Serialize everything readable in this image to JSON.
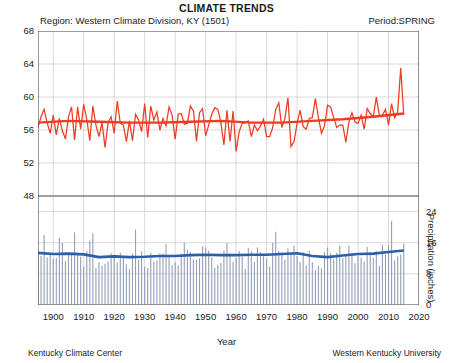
{
  "header": {
    "title": "CLIMATE TRENDS",
    "region": "Region: Western Climate Division, KY   (1501)",
    "period": "Period:SPRING"
  },
  "footer": {
    "left": "Kentucky Climate Center",
    "right": "Western Kentucky University"
  },
  "axes": {
    "xlabel": "Year",
    "ylabel_left": "Air Temperature (deg F)",
    "ylabel_right": "Precipitation (inches)",
    "temp_ticks": [
      "68",
      "64",
      "60",
      "56",
      "52",
      "48"
    ],
    "precip_ticks": [
      "24",
      "16",
      "8",
      "0"
    ],
    "year_ticks": [
      "1900",
      "1910",
      "1920",
      "1930",
      "1940",
      "1950",
      "1960",
      "1970",
      "1980",
      "1990",
      "2000",
      "2010",
      "2020"
    ]
  },
  "colors": {
    "temperature": "#ee3b22",
    "precipitation_bars": "#8d9bb5",
    "precipitation_trend": "#2b5fad",
    "grid": "#c9c9c9",
    "axis": "#555555"
  },
  "chart_data": {
    "type": "line",
    "title": "CLIMATE TRENDS",
    "subtitle": "Region: Western Climate Division, KY   (1501) — Period:SPRING",
    "xlabel": "Year",
    "xlim": [
      1895,
      2020
    ],
    "grid": true,
    "legend": "none",
    "panels": [
      {
        "name": "air-temperature",
        "ylabel": "Air Temperature (deg F)",
        "ylim": [
          48,
          68
        ],
        "yticks": [
          48,
          52,
          56,
          60,
          64,
          68
        ],
        "series": [
          {
            "name": "Spring mean air temperature",
            "type": "line",
            "color": "#ee3b22",
            "x": [
              1895,
              1896,
              1897,
              1898,
              1899,
              1900,
              1901,
              1902,
              1903,
              1904,
              1905,
              1906,
              1907,
              1908,
              1909,
              1910,
              1911,
              1912,
              1913,
              1914,
              1915,
              1916,
              1917,
              1918,
              1919,
              1920,
              1921,
              1922,
              1923,
              1924,
              1925,
              1926,
              1927,
              1928,
              1929,
              1930,
              1931,
              1932,
              1933,
              1934,
              1935,
              1936,
              1937,
              1938,
              1939,
              1940,
              1941,
              1942,
              1943,
              1944,
              1945,
              1946,
              1947,
              1948,
              1949,
              1950,
              1951,
              1952,
              1953,
              1954,
              1955,
              1956,
              1957,
              1958,
              1959,
              1960,
              1961,
              1962,
              1963,
              1964,
              1965,
              1966,
              1967,
              1968,
              1969,
              1970,
              1971,
              1972,
              1973,
              1974,
              1975,
              1976,
              1977,
              1978,
              1979,
              1980,
              1981,
              1982,
              1983,
              1984,
              1985,
              1986,
              1987,
              1988,
              1989,
              1990,
              1991,
              1992,
              1993,
              1994,
              1995,
              1996,
              1997,
              1998,
              1999,
              2000,
              2001,
              2002,
              2003,
              2004,
              2005,
              2006,
              2007,
              2008,
              2009,
              2010,
              2011,
              2012,
              2013,
              2014,
              2015
            ],
            "values": [
              56.3,
              57.6,
              58.5,
              56.9,
              55.6,
              57.8,
              55.4,
              57.4,
              55.9,
              54.9,
              57.6,
              58.8,
              54.8,
              58.8,
              56.1,
              59.1,
              57.3,
              54.7,
              58.9,
              56.6,
              55.2,
              56.9,
              53.9,
              56.9,
              57.6,
              55.6,
              59.5,
              56.8,
              56.6,
              54.6,
              57.1,
              54.7,
              57.9,
              57.2,
              55.8,
              59.2,
              55.1,
              58.9,
              57.2,
              58.2,
              56.0,
              57.4,
              56.5,
              58.8,
              57.8,
              54.9,
              57.9,
              58.0,
              56.7,
              56.8,
              58.9,
              58.3,
              54.6,
              58.1,
              58.6,
              55.3,
              56.6,
              57.9,
              58.7,
              58.5,
              56.9,
              54.2,
              58.4,
              54.6,
              58.3,
              53.4,
              55.8,
              56.8,
              56.9,
              57.1,
              55.2,
              56.6,
              55.9,
              56.5,
              57.3,
              55.2,
              55.2,
              56.3,
              58.5,
              59.3,
              56.3,
              57.4,
              59.9,
              54.0,
              54.6,
              56.8,
              58.4,
              56.4,
              56.1,
              57.4,
              57.5,
              59.8,
              57.5,
              55.6,
              56.5,
              59.0,
              58.8,
              57.5,
              56.3,
              56.6,
              56.6,
              54.5,
              57.0,
              58.1,
              57.0,
              56.8,
              57.8,
              56.1,
              58.6,
              58.0,
              57.6,
              60.0,
              57.7,
              57.8,
              58.5,
              56.6,
              59.2,
              57.5,
              58.2,
              63.5,
              57.8,
              55.2,
              58.2
            ]
          },
          {
            "name": "Temperature trend (smoothed)",
            "type": "line",
            "color": "#ee3b22",
            "x": [
              1895,
              1905,
              1915,
              1925,
              1935,
              1945,
              1955,
              1965,
              1975,
              1985,
              1995,
              2005,
              2015
            ],
            "values": [
              56.9,
              57.1,
              57.0,
              56.9,
              56.9,
              57.0,
              57.1,
              56.9,
              56.9,
              57.1,
              57.3,
              57.6,
              58.0
            ]
          }
        ]
      },
      {
        "name": "precipitation",
        "ylabel": "Precipitation (inches)",
        "ylim": [
          0,
          28
        ],
        "yticks": [
          0,
          8,
          16,
          24
        ],
        "series": [
          {
            "name": "Spring total precipitation",
            "type": "bar",
            "color": "#8d9bb5",
            "x": [
              1895,
              1896,
              1897,
              1898,
              1899,
              1900,
              1901,
              1902,
              1903,
              1904,
              1905,
              1906,
              1907,
              1908,
              1909,
              1910,
              1911,
              1912,
              1913,
              1914,
              1915,
              1916,
              1917,
              1918,
              1919,
              1920,
              1921,
              1922,
              1923,
              1924,
              1925,
              1926,
              1927,
              1928,
              1929,
              1930,
              1931,
              1932,
              1933,
              1934,
              1935,
              1936,
              1937,
              1938,
              1939,
              1940,
              1941,
              1942,
              1943,
              1944,
              1945,
              1946,
              1947,
              1948,
              1949,
              1950,
              1951,
              1952,
              1953,
              1954,
              1955,
              1956,
              1957,
              1958,
              1959,
              1960,
              1961,
              1962,
              1963,
              1964,
              1965,
              1966,
              1967,
              1968,
              1969,
              1970,
              1971,
              1972,
              1973,
              1974,
              1975,
              1976,
              1977,
              1978,
              1979,
              1980,
              1981,
              1982,
              1983,
              1984,
              1985,
              1986,
              1987,
              1988,
              1989,
              1990,
              1991,
              1992,
              1993,
              1994,
              1995,
              1996,
              1997,
              1998,
              1999,
              2000,
              2001,
              2002,
              2003,
              2004,
              2005,
              2006,
              2007,
              2008,
              2009,
              2010,
              2011,
              2012,
              2013,
              2014,
              2015
            ],
            "values": [
              13.5,
              12.6,
              18.0,
              12.2,
              13.4,
              11.9,
              12.1,
              17.2,
              15.9,
              11.3,
              12.8,
              13.0,
              18.6,
              13.1,
              12.4,
              9.8,
              13.8,
              16.6,
              18.4,
              9.6,
              11.0,
              10.1,
              10.6,
              11.2,
              13.3,
              12.9,
              11.0,
              13.4,
              12.6,
              10.4,
              9.2,
              13.2,
              19.4,
              11.6,
              13.8,
              9.8,
              9.5,
              13.4,
              11.2,
              11.5,
              13.2,
              13.3,
              15.6,
              12.8,
              10.3,
              11.0,
              10.2,
              13.2,
              16.0,
              14.2,
              13.6,
              11.7,
              11.6,
              12.0,
              15.1,
              14.8,
              14.0,
              12.2,
              9.6,
              10.3,
              10.8,
              14.0,
              15.9,
              13.2,
              11.1,
              12.1,
              13.9,
              12.4,
              9.3,
              14.7,
              13.9,
              11.1,
              14.8,
              13.6,
              12.5,
              11.8,
              9.9,
              16.0,
              18.8,
              13.9,
              13.5,
              11.7,
              14.6,
              13.5,
              15.2,
              12.6,
              11.0,
              13.6,
              10.2,
              13.9,
              11.0,
              9.0,
              10.1,
              9.4,
              13.6,
              14.8,
              13.3,
              11.8,
              13.4,
              15.2,
              12.0,
              13.0,
              15.3,
              13.4,
              10.7,
              12.5,
              12.2,
              11.2,
              14.9,
              13.6,
              12.1,
              13.8,
              10.0,
              15.5,
              13.0,
              15.4,
              21.6,
              11.5,
              12.5,
              13.0,
              15.8
            ]
          },
          {
            "name": "Precipitation trend (smoothed)",
            "type": "line",
            "color": "#2b5fad",
            "x": [
              1895,
              1900,
              1905,
              1910,
              1915,
              1920,
              1925,
              1930,
              1935,
              1940,
              1945,
              1950,
              1955,
              1960,
              1965,
              1970,
              1975,
              1980,
              1985,
              1990,
              1995,
              2000,
              2005,
              2010,
              2015
            ],
            "values": [
              13.4,
              13.1,
              13.2,
              13.0,
              12.3,
              12.5,
              12.3,
              12.4,
              12.6,
              12.6,
              12.8,
              12.9,
              12.8,
              12.8,
              12.9,
              12.9,
              13.1,
              13.3,
              12.6,
              12.3,
              12.7,
              13.1,
              13.2,
              13.6,
              14.0
            ]
          }
        ]
      }
    ]
  }
}
